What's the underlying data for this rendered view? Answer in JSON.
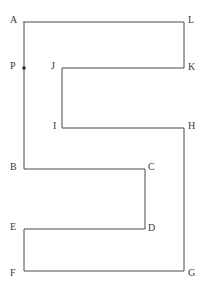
{
  "figure": {
    "background_color": "#ffffff",
    "stroke_color": "#4a4a4a",
    "stroke_width": 1,
    "label_color": "#3a3a3a",
    "marker_color": "#2b2b2b",
    "canvas": {
      "width": 205,
      "height": 289
    },
    "path_order": [
      "A",
      "L",
      "K",
      "J",
      "I",
      "H",
      "G",
      "F",
      "E",
      "D",
      "C",
      "B",
      "A"
    ],
    "vertices": [
      {
        "id": "A",
        "label": "A",
        "x": 24,
        "y": 22,
        "label_x": 10,
        "label_y": 15,
        "marker": false
      },
      {
        "id": "L",
        "label": "L",
        "x": 184,
        "y": 22,
        "label_x": 188,
        "label_y": 15,
        "marker": false
      },
      {
        "id": "K",
        "label": "K",
        "x": 184,
        "y": 68,
        "label_x": 188,
        "label_y": 62,
        "marker": false
      },
      {
        "id": "J",
        "label": "J",
        "x": 62,
        "y": 68,
        "label_x": 51,
        "label_y": 61,
        "marker": false
      },
      {
        "id": "I",
        "label": "I",
        "x": 62,
        "y": 128,
        "label_x": 53,
        "label_y": 121,
        "marker": false
      },
      {
        "id": "H",
        "label": "H",
        "x": 184,
        "y": 128,
        "label_x": 188,
        "label_y": 121,
        "marker": false
      },
      {
        "id": "G",
        "label": "G",
        "x": 184,
        "y": 271,
        "label_x": 188,
        "label_y": 268,
        "marker": false
      },
      {
        "id": "F",
        "label": "F",
        "x": 24,
        "y": 271,
        "label_x": 10,
        "label_y": 268,
        "marker": false
      },
      {
        "id": "E",
        "label": "E",
        "x": 24,
        "y": 229,
        "label_x": 10,
        "label_y": 222,
        "marker": false
      },
      {
        "id": "D",
        "label": "D",
        "x": 145,
        "y": 229,
        "label_x": 148,
        "label_y": 223,
        "marker": false
      },
      {
        "id": "C",
        "label": "C",
        "x": 145,
        "y": 169,
        "label_x": 148,
        "label_y": 162,
        "marker": false
      },
      {
        "id": "B",
        "label": "B",
        "x": 24,
        "y": 169,
        "label_x": 10,
        "label_y": 162,
        "marker": false
      }
    ],
    "points_on_edges": [
      {
        "id": "P",
        "label": "P",
        "x": 24,
        "y": 68,
        "label_x": 10,
        "label_y": 61,
        "on_edge": "A-B",
        "marker": true
      }
    ]
  }
}
